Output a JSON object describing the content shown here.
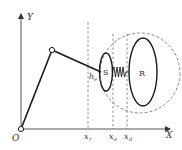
{
  "diagram": {
    "type": "robot-arm-contact-schematic",
    "axes": {
      "x_label": "X",
      "y_label": "Y",
      "origin_label": "O"
    },
    "markers": [
      {
        "id": "x_r",
        "label": "x",
        "subscript": "r"
      },
      {
        "id": "x_e",
        "label": "x",
        "subscript": "e"
      },
      {
        "id": "x_d",
        "label": "x",
        "subscript": "d"
      }
    ],
    "distance_label": {
      "label": "h",
      "subscript": "e"
    },
    "bodies": {
      "small": {
        "label": "S"
      },
      "large": {
        "label": "R"
      }
    },
    "colors": {
      "line": "#1a1a1a",
      "axis": "#555555",
      "dashed": "#777777",
      "text": "#333333"
    }
  }
}
